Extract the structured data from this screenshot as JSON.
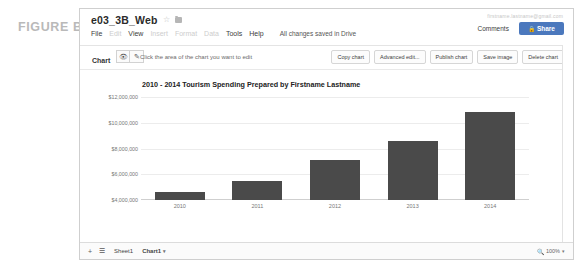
{
  "figure": {
    "label": "FIGURE B"
  },
  "header": {
    "doc_title": "e03_3B_Web",
    "star_icon": "star-icon",
    "folder_icon": "folder-icon",
    "account_email": "firstname.lastname@gmail.com",
    "menus": [
      {
        "label": "File",
        "enabled": true
      },
      {
        "label": "Edit",
        "enabled": false
      },
      {
        "label": "View",
        "enabled": true
      },
      {
        "label": "Insert",
        "enabled": false
      },
      {
        "label": "Format",
        "enabled": false
      },
      {
        "label": "Data",
        "enabled": false
      },
      {
        "label": "Tools",
        "enabled": true
      },
      {
        "label": "Help",
        "enabled": true
      }
    ],
    "save_status": "All changes saved in Drive",
    "comments_label": "Comments",
    "share_label": "Share",
    "share_color": "#4b78bd",
    "lock_icon": "lock-icon"
  },
  "chart_toolbar": {
    "chart_label": "Chart",
    "eye_icon": "eye-icon",
    "pencil_icon": "pencil-icon",
    "hint": "Click the area of the chart you want to edit",
    "buttons": [
      "Copy chart",
      "Advanced edit...",
      "Publish chart",
      "Save image",
      "Delete chart"
    ]
  },
  "chart_data": {
    "type": "bar",
    "title": "2010 - 2014 Tourism Spending Prepared by Firstname Lastname",
    "xlabel": "",
    "ylabel": "",
    "categories": [
      "2010",
      "2011",
      "2012",
      "2013",
      "2014"
    ],
    "values": [
      4600000,
      5500000,
      7100000,
      8600000,
      10800000
    ],
    "ylim": [
      4000000,
      12000000
    ],
    "yticks": [
      4000000,
      6000000,
      8000000,
      10000000,
      12000000
    ],
    "ytick_labels": [
      "$4,000,000",
      "$6,000,000",
      "$8,000,000",
      "$10,000,000",
      "$12,000,000"
    ],
    "bar_color": "#4a4a4a",
    "grid": true,
    "legend": false,
    "legend_position": "none"
  },
  "footer": {
    "add_sheet_icon": "plus-icon",
    "all_sheets_icon": "list-icon",
    "tabs": [
      {
        "label": "Sheet1",
        "active": false
      },
      {
        "label": "Chart1",
        "active": true
      }
    ],
    "chart_tab_caret": "caret-down-icon",
    "zoom_icon": "magnifier-icon",
    "zoom_level": "100%",
    "zoom_caret": "caret-down-icon"
  }
}
